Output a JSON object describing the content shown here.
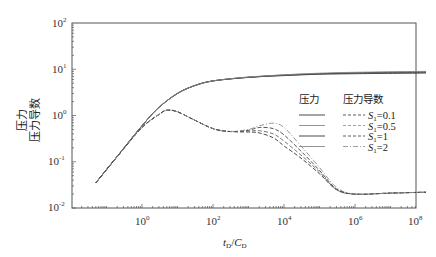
{
  "chart_data": {
    "type": "line",
    "title": "",
    "xlabel": "t_D/C_D",
    "ylabel": "压力 / 压力导数",
    "ylabel_lines": [
      "压力",
      "压力导数"
    ],
    "xscale": "log",
    "yscale": "log",
    "xlim": [
      0.01,
      100000000
    ],
    "ylim": [
      0.01,
      100
    ],
    "x_ticks": [
      "10^0",
      "10^2",
      "10^4",
      "10^6",
      "10^8"
    ],
    "y_ticks": [
      "10^-2",
      "10^-1",
      "10^0",
      "10^1",
      "10^2"
    ],
    "grid": false,
    "legend": {
      "position": "center-right",
      "headers": [
        "压力",
        "压力导数"
      ],
      "entries": [
        "S1=0.1",
        "S1=0.5",
        "S1=1",
        "S1=2"
      ]
    },
    "series": [
      {
        "name": "压力 S1=0.1",
        "style": "solid",
        "color": "#222222",
        "points": [
          [
            0.05,
            0.035
          ],
          [
            0.2,
            0.13
          ],
          [
            1,
            0.6
          ],
          [
            3,
            1.5
          ],
          [
            10,
            3.0
          ],
          [
            30,
            4.4
          ],
          [
            100,
            5.6
          ],
          [
            1000,
            6.7
          ],
          [
            10000,
            7.3
          ],
          [
            100000,
            7.8
          ],
          [
            1000000,
            8.0
          ],
          [
            100000000,
            8.3
          ]
        ]
      },
      {
        "name": "压力 S1=0.5",
        "style": "solid",
        "color": "#666666",
        "points": [
          [
            0.05,
            0.035
          ],
          [
            0.2,
            0.13
          ],
          [
            1,
            0.6
          ],
          [
            3,
            1.5
          ],
          [
            10,
            3.0
          ],
          [
            30,
            4.4
          ],
          [
            100,
            5.6
          ],
          [
            1000,
            6.7
          ],
          [
            10000,
            7.4
          ],
          [
            100000,
            7.9
          ],
          [
            1000000,
            8.2
          ],
          [
            100000000,
            8.5
          ]
        ]
      },
      {
        "name": "压力 S1=1",
        "style": "solid",
        "color": "#333333",
        "points": [
          [
            0.05,
            0.035
          ],
          [
            0.2,
            0.13
          ],
          [
            1,
            0.6
          ],
          [
            3,
            1.5
          ],
          [
            10,
            3.0
          ],
          [
            30,
            4.4
          ],
          [
            100,
            5.6
          ],
          [
            1000,
            6.7
          ],
          [
            10000,
            7.5
          ],
          [
            100000,
            8.0
          ],
          [
            1000000,
            8.4
          ],
          [
            100000000,
            8.8
          ]
        ]
      },
      {
        "name": "压力 S1=2",
        "style": "solid",
        "color": "#888888",
        "points": [
          [
            0.05,
            0.035
          ],
          [
            0.2,
            0.13
          ],
          [
            1,
            0.6
          ],
          [
            3,
            1.5
          ],
          [
            10,
            3.0
          ],
          [
            30,
            4.4
          ],
          [
            100,
            5.6
          ],
          [
            1000,
            6.8
          ],
          [
            10000,
            7.6
          ],
          [
            100000,
            8.2
          ],
          [
            1000000,
            8.6
          ],
          [
            100000000,
            9.0
          ]
        ]
      },
      {
        "name": "压力导数 S1=0.1",
        "style": "dashed",
        "color": "#333333",
        "points": [
          [
            0.05,
            0.035
          ],
          [
            0.2,
            0.13
          ],
          [
            1,
            0.55
          ],
          [
            3,
            1.05
          ],
          [
            5,
            1.3
          ],
          [
            10,
            1.2
          ],
          [
            30,
            0.8
          ],
          [
            100,
            0.52
          ],
          [
            300,
            0.45
          ],
          [
            1000,
            0.44
          ],
          [
            2000,
            0.42
          ],
          [
            5000,
            0.33
          ],
          [
            10000,
            0.22
          ],
          [
            30000,
            0.12
          ],
          [
            100000,
            0.055
          ],
          [
            300000,
            0.025
          ],
          [
            1000000,
            0.02
          ],
          [
            10000000,
            0.021
          ],
          [
            100000000,
            0.022
          ]
        ]
      },
      {
        "name": "压力导数 S1=0.5",
        "style": "dashed",
        "color": "#666666",
        "points": [
          [
            0.05,
            0.035
          ],
          [
            0.2,
            0.13
          ],
          [
            1,
            0.55
          ],
          [
            3,
            1.05
          ],
          [
            5,
            1.3
          ],
          [
            10,
            1.2
          ],
          [
            30,
            0.8
          ],
          [
            100,
            0.52
          ],
          [
            300,
            0.45
          ],
          [
            1000,
            0.46
          ],
          [
            2000,
            0.47
          ],
          [
            5000,
            0.4
          ],
          [
            10000,
            0.28
          ],
          [
            30000,
            0.14
          ],
          [
            100000,
            0.06
          ],
          [
            300000,
            0.025
          ],
          [
            1000000,
            0.02
          ],
          [
            10000000,
            0.021
          ],
          [
            100000000,
            0.022
          ]
        ]
      },
      {
        "name": "压力导数 S1=1",
        "style": "dashed",
        "color": "#444444",
        "points": [
          [
            0.05,
            0.035
          ],
          [
            0.2,
            0.13
          ],
          [
            1,
            0.55
          ],
          [
            3,
            1.05
          ],
          [
            5,
            1.3
          ],
          [
            10,
            1.2
          ],
          [
            30,
            0.8
          ],
          [
            100,
            0.52
          ],
          [
            300,
            0.45
          ],
          [
            1000,
            0.48
          ],
          [
            2000,
            0.55
          ],
          [
            5000,
            0.52
          ],
          [
            10000,
            0.38
          ],
          [
            30000,
            0.17
          ],
          [
            100000,
            0.065
          ],
          [
            300000,
            0.026
          ],
          [
            1000000,
            0.02
          ],
          [
            10000000,
            0.021
          ],
          [
            100000000,
            0.022
          ]
        ]
      },
      {
        "name": "压力导数 S1=2",
        "style": "dashdot",
        "color": "#888888",
        "points": [
          [
            0.05,
            0.035
          ],
          [
            0.2,
            0.13
          ],
          [
            1,
            0.55
          ],
          [
            3,
            1.05
          ],
          [
            5,
            1.3
          ],
          [
            10,
            1.2
          ],
          [
            30,
            0.8
          ],
          [
            100,
            0.52
          ],
          [
            300,
            0.45
          ],
          [
            1000,
            0.5
          ],
          [
            2000,
            0.6
          ],
          [
            5000,
            0.68
          ],
          [
            10000,
            0.55
          ],
          [
            30000,
            0.22
          ],
          [
            100000,
            0.075
          ],
          [
            300000,
            0.028
          ],
          [
            1000000,
            0.02
          ],
          [
            10000000,
            0.021
          ],
          [
            100000000,
            0.022
          ]
        ]
      }
    ]
  },
  "labels": {
    "xlabel_t": "t",
    "xlabel_t_sub": "D",
    "xlabel_slash": "/",
    "xlabel_c": "C",
    "xlabel_c_sub": "D",
    "ylabel_line1": "压力",
    "ylabel_line2": "压力导数",
    "legend_header_pressure": "压力",
    "legend_header_derivative": "压力导数",
    "legend_s": "S",
    "legend_s_sub": "1",
    "legend_values": [
      "=0.1",
      "=0.5",
      "=1",
      "=2"
    ],
    "x_tick_base": "10",
    "x_tick_exps": [
      "0",
      "2",
      "4",
      "6",
      "8"
    ],
    "y_tick_base": "10",
    "y_tick_exps": [
      "2",
      "1",
      "0",
      "-1",
      "-2"
    ]
  }
}
